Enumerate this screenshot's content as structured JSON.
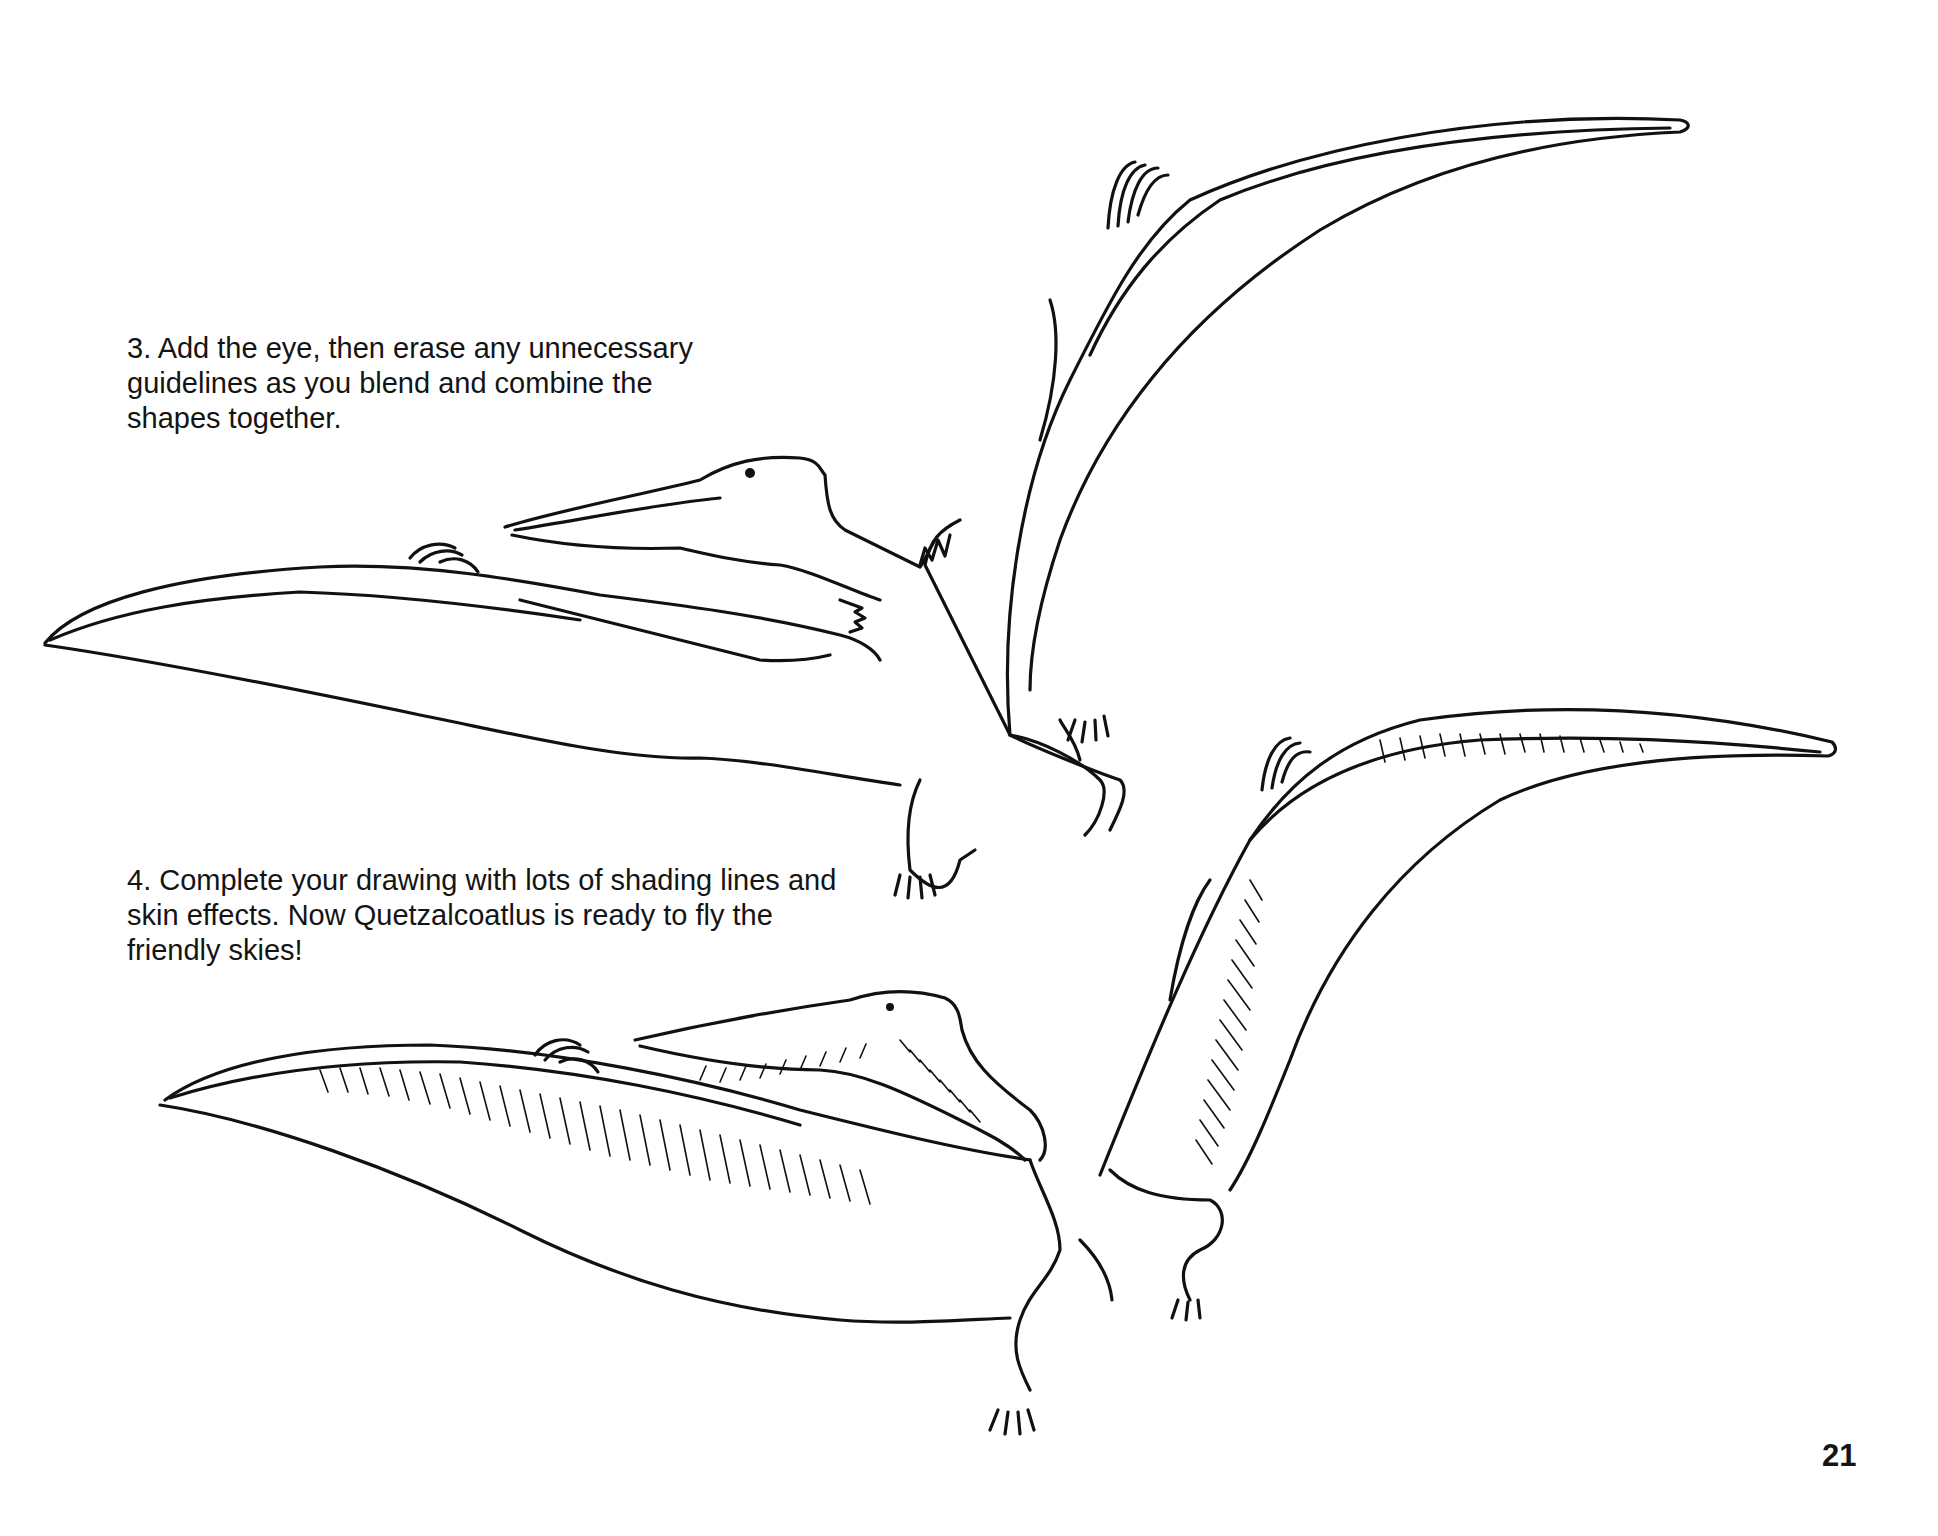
{
  "page": {
    "steps": [
      {
        "number": "3.",
        "text": "3.  Add the eye, then erase any unnecessary guidelines as you blend and combine the shapes together."
      },
      {
        "number": "4.",
        "text": "4.  Complete your drawing with lots of shading lines and skin effects. Now Quetzalcoatlus is ready to fly the friendly skies!"
      }
    ],
    "page_number": "21",
    "illustrations": [
      {
        "subject": "Quetzalcoatlus",
        "stage": "step 3 outline with eye"
      },
      {
        "subject": "Quetzalcoatlus",
        "stage": "step 4 shaded final drawing"
      }
    ]
  }
}
